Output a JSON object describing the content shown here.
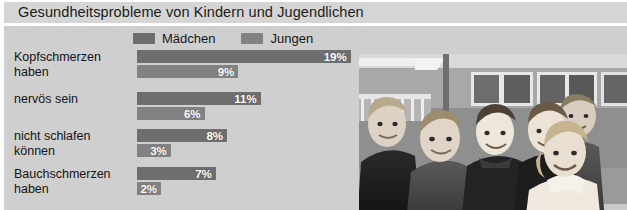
{
  "title": "Gesundheitsprobleme von Kindern und Jugendlichen",
  "legend": {
    "items": [
      {
        "label": "Mädchen",
        "color": "#6e6e6e",
        "swatch_name": "legend-swatch-maedchen"
      },
      {
        "label": "Jungen",
        "color": "#828282",
        "swatch_name": "legend-swatch-jungen"
      }
    ]
  },
  "photo": {
    "caption": "Schwarz-weiß-Foto: sechs Kinder und Jugendliche vor einem Gebäude",
    "alt": "group-of-children-photo"
  },
  "chart_data": {
    "type": "bar",
    "orientation": "horizontal",
    "title": "Gesundheitsprobleme von Kindern und Jugendlichen",
    "xlabel": "",
    "ylabel": "",
    "xlim": [
      0,
      20
    ],
    "unit": "%",
    "grid": false,
    "legend_position": "top",
    "categories": [
      "Kopfschmerzen haben",
      "nervös sein",
      "nicht schlafen können",
      "Bauchschmerzen haben"
    ],
    "series": [
      {
        "name": "Mädchen",
        "color": "#6e6e6e",
        "values": [
          19,
          11,
          8,
          7
        ],
        "labels": [
          "19%",
          "11%",
          "8%",
          "7%"
        ]
      },
      {
        "name": "Jungen",
        "color": "#828282",
        "values": [
          9,
          6,
          3,
          2
        ],
        "labels": [
          "9%",
          "6%",
          "3%",
          "2%"
        ]
      }
    ],
    "groups": [
      {
        "label_line1": "Kopfschmerzen",
        "label_line2": "haben",
        "bars": [
          {
            "series": "Mädchen",
            "value": 19,
            "label": "19%",
            "color": "#6e6e6e"
          },
          {
            "series": "Jungen",
            "value": 9,
            "label": "9%",
            "color": "#828282"
          }
        ]
      },
      {
        "label_line1": "nervös sein",
        "label_line2": "",
        "bars": [
          {
            "series": "Mädchen",
            "value": 11,
            "label": "11%",
            "color": "#6e6e6e"
          },
          {
            "series": "Jungen",
            "value": 6,
            "label": "6%",
            "color": "#828282"
          }
        ]
      },
      {
        "label_line1": "nicht schlafen",
        "label_line2": "können",
        "bars": [
          {
            "series": "Mädchen",
            "value": 8,
            "label": "8%",
            "color": "#6e6e6e"
          },
          {
            "series": "Jungen",
            "value": 3,
            "label": "3%",
            "color": "#828282"
          }
        ]
      },
      {
        "label_line1": "Bauchschmerzen",
        "label_line2": "haben",
        "bars": [
          {
            "series": "Mädchen",
            "value": 7,
            "label": "7%",
            "color": "#6e6e6e"
          },
          {
            "series": "Jungen",
            "value": 2,
            "label": "2%",
            "color": "#828282"
          }
        ]
      }
    ]
  },
  "colors": {
    "title_band": "#d5d5d5",
    "panel": "#cfcfcf",
    "maedchen": "#6e6e6e",
    "jungen": "#828282",
    "text": "#141414"
  }
}
